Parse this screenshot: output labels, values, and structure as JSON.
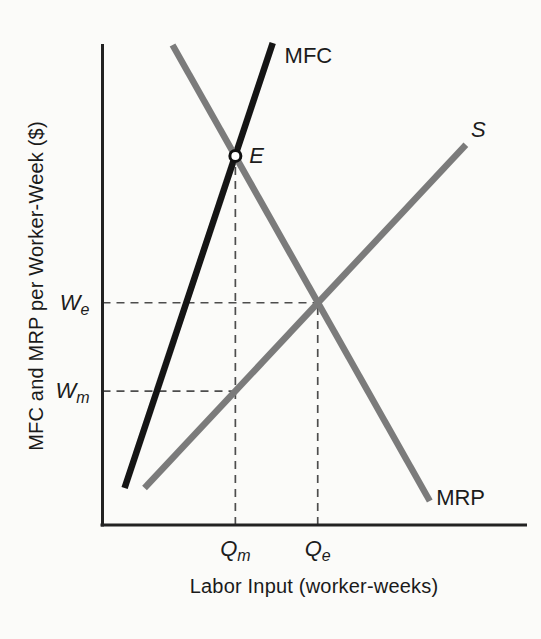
{
  "figure": {
    "y_axis_title": "MFC and MRP per Worker-Week ($)",
    "x_axis_title": "Labor Input (worker-weeks)"
  },
  "colors": {
    "background": "#fbfbf9",
    "axis": "#222222",
    "dash": "#4d4d4d",
    "text": "#1c1c1c",
    "mfc": "#151515",
    "supply": "#7b7b7b",
    "mrp": "#7b7b7b",
    "marker_fill": "#ffffff",
    "marker_stroke": "#101010"
  },
  "chart_data": {
    "type": "line",
    "title": "",
    "xlabel": "Labor Input (worker-weeks)",
    "ylabel": "MFC and MRP per Worker-Week ($)",
    "xlim": [
      0,
      10
    ],
    "ylim": [
      0,
      10
    ],
    "grid": false,
    "numeric_ticks": false,
    "legend": "none (curves labeled inline)",
    "series": [
      {
        "name": "MFC",
        "role": "marginal-factor-cost",
        "points": [
          [
            0.52,
            0.77
          ],
          [
            4.01,
            10.04
          ]
        ],
        "color_key": "mfc",
        "label_italic": false,
        "label_pos": [
          4.29,
          9.78
        ]
      },
      {
        "name": "S",
        "role": "labor-supply",
        "points": [
          [
            0.99,
            0.77
          ],
          [
            8.56,
            7.92
          ]
        ],
        "color_key": "supply",
        "label_italic": true,
        "label_pos": [
          8.68,
          8.22
        ]
      },
      {
        "name": "MRP",
        "role": "marginal-revenue-product",
        "points": [
          [
            1.65,
            10.0
          ],
          [
            7.71,
            0.5
          ]
        ],
        "color_key": "mrp",
        "label_italic": false,
        "label_pos": [
          7.86,
          0.56
        ]
      }
    ],
    "key_points": [
      {
        "id": "E",
        "label": "E",
        "description": "intersection of MFC and MRP",
        "x": 3.13,
        "y": 7.69,
        "marker": "open-circle"
      },
      {
        "id": "competitive-equilibrium",
        "label": "",
        "description": "intersection of S and MRP",
        "x": 5.07,
        "y": 4.63,
        "marker": "none"
      }
    ],
    "guides": [
      {
        "id": "we",
        "orient": "h",
        "value": 4.63,
        "extent": 5.07,
        "axis_label": {
          "main": "W",
          "sub": "e"
        }
      },
      {
        "id": "wm",
        "orient": "h",
        "value": 2.79,
        "extent": 3.13,
        "axis_label": {
          "main": "W",
          "sub": "m"
        }
      },
      {
        "id": "qm",
        "orient": "v",
        "value": 3.13,
        "extent": 7.69,
        "axis_label": {
          "main": "Q",
          "sub": "m"
        }
      },
      {
        "id": "qe",
        "orient": "v",
        "value": 5.07,
        "extent": 4.63,
        "axis_label": {
          "main": "Q",
          "sub": "e"
        }
      }
    ]
  }
}
